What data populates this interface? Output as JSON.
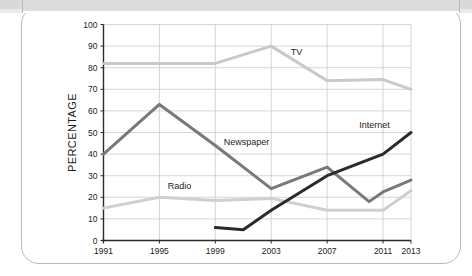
{
  "card": {
    "border_color": "#b9b9b9",
    "background": "#ffffff",
    "top_band_color": "#dcdcdc"
  },
  "chart_data": {
    "type": "line",
    "title": "",
    "subtitle": "",
    "xlabel": "",
    "ylabel": "PERCENTAGE",
    "xlim": [
      1991,
      2013
    ],
    "ylim": [
      0,
      100
    ],
    "grid": true,
    "legend_position": "inline-labels",
    "x_tick_labels": [
      "1991",
      "1995",
      "1999",
      "2003",
      "2007",
      "2011",
      "2013"
    ],
    "x_ticks": [
      1991,
      1995,
      1999,
      2003,
      2007,
      2011,
      2013
    ],
    "y_tick_labels": [
      "0",
      "10",
      "20",
      "30",
      "40",
      "50",
      "60",
      "70",
      "80",
      "90",
      "100"
    ],
    "y_ticks": [
      0,
      10,
      20,
      30,
      40,
      50,
      60,
      70,
      80,
      90,
      100
    ],
    "series": [
      {
        "name": "TV",
        "color": "#c9c9c9",
        "label_x": 2004.4,
        "label_y": 86,
        "x": [
          1991,
          1995,
          1999,
          2003,
          2007,
          2011,
          2013
        ],
        "values": [
          82,
          82,
          82,
          90,
          74,
          74.5,
          70
        ]
      },
      {
        "name": "Newspaper",
        "color": "#797979",
        "label_x": 1999.6,
        "label_y": 44,
        "x": [
          1991,
          1995,
          1999,
          2003,
          2007,
          2010,
          2011,
          2013
        ],
        "values": [
          40,
          63,
          44,
          24,
          34,
          18,
          22.5,
          28
        ]
      },
      {
        "name": "Radio",
        "color": "#cfcfcf",
        "label_x": 1995.6,
        "label_y": 24,
        "x": [
          1991,
          1995,
          1999,
          2003,
          2007,
          2011,
          2013
        ],
        "values": [
          15,
          20,
          18.5,
          19.5,
          14,
          14,
          23
        ]
      },
      {
        "name": "Internet",
        "color": "#2b2b2b",
        "label_x": 2009.3,
        "label_y": 52,
        "x": [
          1999,
          2001,
          2003,
          2007,
          2011,
          2013
        ],
        "values": [
          6,
          5,
          14,
          30,
          40,
          50
        ]
      }
    ]
  }
}
